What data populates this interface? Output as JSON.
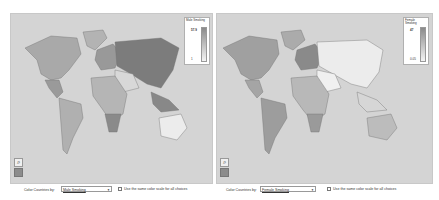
{
  "left": {
    "legend": {
      "title": "Male Smoking",
      "max": "57.9",
      "min": "1"
    },
    "controls": {
      "color_label": "Color Countries by:",
      "selected": "Male Smoking",
      "checkbox_label": "Use the same color scale for all choices",
      "checked": false
    },
    "shading": {
      "na": "#a9a9a9",
      "russia_asia": "#7c7c7c",
      "europe": "#999999",
      "africa": "#b5b5b5",
      "southern_africa": "#8a8a8a",
      "south_america": "#b0b0b0",
      "central_america": "#9a9a9a",
      "australia": "#ececec",
      "greenland": "#b3b3b3",
      "middle_east": "#d8d8d8",
      "se_asia": "#888888"
    }
  },
  "right": {
    "legend": {
      "title": "Female Smoking",
      "max": "47",
      "min": "0.05"
    },
    "controls": {
      "color_label": "Color Countries by:",
      "selected": "Female Smoking",
      "checkbox_label": "Use the same color scale for all choices",
      "checked": false
    },
    "shading": {
      "na": "#a0a0a0",
      "russia_asia": "#ececec",
      "europe": "#8a8a8a",
      "africa": "#b8b8b8",
      "southern_africa": "#9a9a9a",
      "south_america": "#9d9d9d",
      "central_america": "#a5a5a5",
      "australia": "#bcbcbc",
      "greenland": "#ababab",
      "middle_east": "#f0f0f0",
      "se_asia": "#d6d6d6"
    }
  },
  "tools": {
    "zoom_icon": "magnifier-icon",
    "swatch_icon": "color-swatch-icon"
  }
}
